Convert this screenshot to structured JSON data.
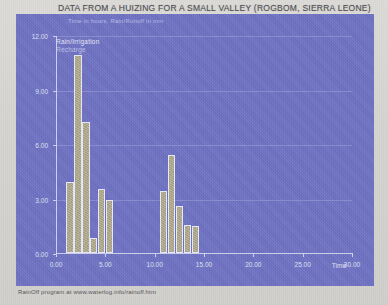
{
  "document": {
    "title": "DATA FROM A HUIZING FOR A SMALL VALLEY (ROGBOM, SIERRA LEONE)",
    "footer": "RainOff program at www.waterlog.info/rainoff.htm"
  },
  "chart_data": {
    "type": "bar",
    "title": "DATA FROM A HUIZING FOR A SMALL VALLEY (ROGBOM, SIERRA LEONE)",
    "subtitle": "Time in hours, Rain/Runoff in mm",
    "xlabel": "Time",
    "ylabel": "",
    "xlim": [
      0,
      30
    ],
    "ylim": [
      0,
      12
    ],
    "grid": true,
    "legend_position": "top-left",
    "xticks": [
      "0.00",
      "5.00",
      "10.00",
      "15.00",
      "20.00",
      "25.00",
      "30.00"
    ],
    "xtick_values": [
      0,
      5,
      10,
      15,
      20,
      25,
      30
    ],
    "yticks": [
      "0.00",
      "3.00",
      "6.00",
      "9.00",
      "12.00"
    ],
    "ytick_values": [
      0,
      3,
      6,
      9,
      12
    ],
    "legend": [
      {
        "label": "Rain/Irrigation",
        "color": "#e6e7f6"
      },
      {
        "label": "Recharge",
        "color": "#bfc1e8"
      }
    ],
    "series": [
      {
        "name": "Rain/Irrigation",
        "bars": [
          {
            "x": 1.05,
            "width": 0.75,
            "value": 3.9
          },
          {
            "x": 1.85,
            "width": 0.75,
            "value": 10.9
          },
          {
            "x": 2.65,
            "width": 0.75,
            "value": 7.2
          },
          {
            "x": 3.45,
            "width": 0.75,
            "value": 0.85
          },
          {
            "x": 4.25,
            "width": 0.75,
            "value": 3.5
          },
          {
            "x": 5.05,
            "width": 0.75,
            "value": 2.9
          },
          {
            "x": 10.55,
            "width": 0.75,
            "value": 3.4
          },
          {
            "x": 11.35,
            "width": 0.75,
            "value": 5.4
          },
          {
            "x": 12.15,
            "width": 0.75,
            "value": 2.6
          },
          {
            "x": 12.95,
            "width": 0.75,
            "value": 1.55
          },
          {
            "x": 13.75,
            "width": 0.75,
            "value": 1.5
          }
        ]
      }
    ]
  }
}
